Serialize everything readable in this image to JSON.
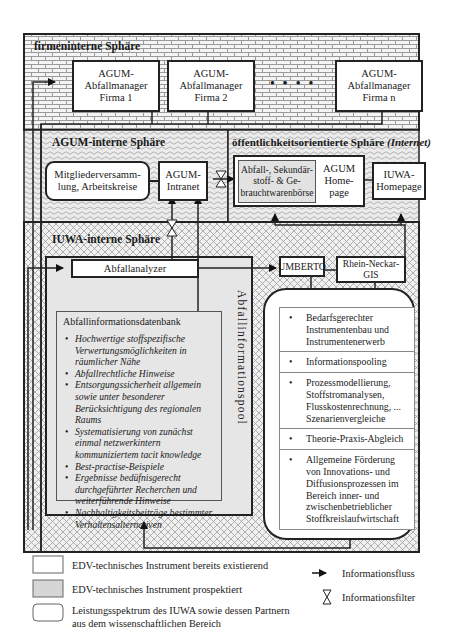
{
  "spheres": {
    "company_internal": {
      "title": "firmeninterne Sphäre"
    },
    "agum_internal": {
      "title": "AGUM-interne Sphäre"
    },
    "public": {
      "title": "öffentlichkeitsorientierte Sphäre",
      "title_suffix": "(Internet)"
    },
    "iuwa_internal": {
      "title": "IUWA-interne Sphäre"
    }
  },
  "company_boxes": [
    {
      "line1": "AGUM-",
      "line2": "Abfallmanager",
      "line3": "Firma 1"
    },
    {
      "line1": "AGUM-",
      "line2": "Abfallmanager",
      "line3": "Firma 2"
    },
    {
      "line1": "AGUM-",
      "line2": "Abfallmanager",
      "line3": "Firma n"
    }
  ],
  "ellipsis": "● ● ● ●",
  "agum": {
    "members_box": {
      "line1": "Mitgliederversamm-",
      "line2": "lung, Arbeitskreise"
    },
    "intranet_box": {
      "line1": "AGUM-",
      "line2": "Intranet"
    }
  },
  "public": {
    "exchange_box": {
      "line1": "Abfall-, Sekundär-",
      "line2": "stoff- & Ge-",
      "line3": "brauchtwarenbörse"
    },
    "homepage_box": {
      "line1": "AGUM",
      "line2": "Home-",
      "line3": "page"
    },
    "iuwa_homepage_box": {
      "line1": "IUWA-",
      "line2": "Homepage"
    }
  },
  "iuwa": {
    "analyzer": "Abfallanalyzer",
    "umberto": "UMBERTO",
    "gis": {
      "line1": "Rhein-Neckar-",
      "line2": "GIS"
    },
    "pool_label": "Abfallinformationspool",
    "database": {
      "title": "Abfallinformationsdatenbank",
      "items": [
        "Hochwertige stoffspezifische Verwertungsmöglichkeiten in räumlicher Nähe",
        "Abfallrechtliche Hinweise",
        "Entsorgungssicherheit allgemein sowie unter besonderer Berücksichtigung des regionalen Raums",
        "Systematisierung von zunächst einmal netzwerkintern kommuniziertem tacit knowledge",
        "Best-practise-Beispiele",
        "Ergebnisse bedüfnisgerecht durchgeführter Recherchen und weiterführende Hinweise",
        "Nachhaltigkeitsbeiträge bestimmter Verhaltensalternativen"
      ]
    },
    "services": [
      "Bedarfsgerechter Instrumentenbau und Instrumentenerwerb",
      "Informationspooling",
      "Prozessmodellierung, Stoffstromanalysen, Flusskostenrechnung, ... Szenarienvergleiche",
      "Theorie-Praxis-Abgleich",
      "Allgemeine Förderung von Innovations- und Diffusionsprozessen im Bereich inner- und zwischenbetrieblicher Stoffkreislaufwirtschaft"
    ]
  },
  "legend": {
    "existing": "EDV-technisches Instrument bereits existierend",
    "prospective": "EDV-technisches Instrument prospektiert",
    "scope_line1": "Leistungsspektrum des IUWA sowie dessen Partnern",
    "scope_line2": "aus dem wissenschaftlichen Bereich",
    "flow": "Informationsfluss",
    "filter": "Informationsfilter"
  },
  "colors": {
    "line": "#222222",
    "prospective_fill": "#e2e2e2",
    "pool_fill": "#e6e6e6"
  }
}
